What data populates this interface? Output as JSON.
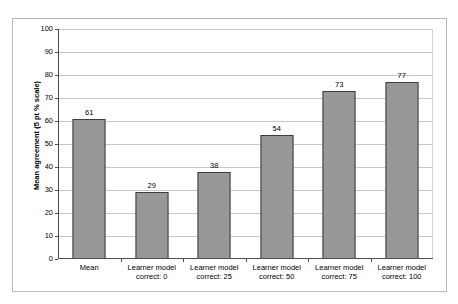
{
  "page_header": {
    "text": "",
    "note": "illegible clipped header"
  },
  "chart_data": {
    "type": "bar",
    "title": "",
    "xlabel": "",
    "ylabel": "Mean agreement (5 pt % scale)",
    "ylim": [
      0,
      100
    ],
    "ytick_labels": [
      "0",
      "10",
      "20",
      "30",
      "40",
      "50",
      "60",
      "70",
      "80",
      "90",
      "100"
    ],
    "yticks": [
      0,
      10,
      20,
      30,
      40,
      50,
      60,
      70,
      80,
      90,
      100
    ],
    "grid": true,
    "legend": false,
    "categories": [
      "Mean",
      "Learner model correct: 0",
      "Learner model correct: 25",
      "Learner model correct: 50",
      "Learner model correct: 75",
      "Learner model correct: 100"
    ],
    "category_lines": [
      [
        "Mean",
        ""
      ],
      [
        "Learner model",
        "correct: 0"
      ],
      [
        "Learner model",
        "correct: 25"
      ],
      [
        "Learner model",
        "correct: 50"
      ],
      [
        "Learner model",
        "correct: 75"
      ],
      [
        "Learner model",
        "correct: 100"
      ]
    ],
    "values": [
      61,
      29,
      38,
      54,
      73,
      77
    ],
    "value_labels": [
      "61",
      "29",
      "38",
      "54",
      "73",
      "77"
    ],
    "colors": {
      "bar_fill": "#989898",
      "bar_border": "#3d3d3d",
      "gridline": "#c7c7c7",
      "axis": "#4d4d4d",
      "frame": "#b9b9b9",
      "background": "#ffffff",
      "text": "#000000"
    }
  }
}
